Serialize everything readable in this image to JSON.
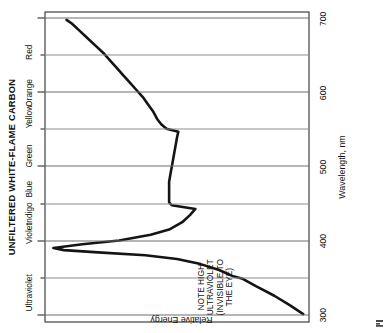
{
  "figure": {
    "title": "UNFILTERED WHITE-FLAME CARBON",
    "corner_mark": "print-registration-mark"
  },
  "annotation": {
    "line1": "NOTE HIGH",
    "line2": "ULTRAVIOLET",
    "line3": "(INVISIBLE TO",
    "line4": "THE EYE)"
  },
  "chart_data": {
    "type": "line",
    "title": "UNFILTERED WHITE-FLAME CARBON",
    "xlabel": "Wavelength, nm",
    "ylabel": "Relative Energy",
    "xlim": [
      290,
      710
    ],
    "ylim": [
      0,
      100
    ],
    "grid": true,
    "grid_axis": "x",
    "legend": "none",
    "orientation_note": "figure printed rotated 90 degrees counter-clockwise",
    "xticks": [
      300,
      400,
      500,
      600,
      700
    ],
    "xtick_labels": [
      "300",
      "400",
      "500",
      "600",
      "700"
    ],
    "xminor_ticks": [
      350,
      450,
      550,
      650
    ],
    "yticks": [],
    "ytick_labels": [],
    "band_labels": [
      {
        "label": "Ultraviolet",
        "wavelength": 330
      },
      {
        "label": "Violet",
        "wavelength": 410
      },
      {
        "label": "Indigo",
        "wavelength": 437
      },
      {
        "label": "Blue",
        "wavelength": 470
      },
      {
        "label": "Green",
        "wavelength": 515
      },
      {
        "label": "Yellow",
        "wavelength": 568
      },
      {
        "label": "Orange",
        "wavelength": 600
      },
      {
        "label": "Red",
        "wavelength": 655
      }
    ],
    "series": [
      {
        "name": "Unfiltered white-flame carbon arc",
        "x": [
          300,
          312,
          325,
          338,
          348,
          352,
          360,
          368,
          375,
          380,
          384,
          387,
          390,
          395,
          400,
          408,
          415,
          425,
          435,
          443,
          448,
          452,
          458,
          465,
          472,
          480,
          490,
          500,
          510,
          520,
          530,
          540,
          548,
          552,
          558,
          565,
          575,
          585,
          595,
          605,
          615,
          625,
          635,
          645,
          655,
          665,
          675,
          685,
          695,
          700
        ],
        "y": [
          2,
          7,
          13,
          20,
          25,
          29,
          34,
          41,
          50,
          62,
          80,
          93,
          97,
          86,
          72,
          60,
          53,
          48,
          45,
          43,
          52,
          53,
          53,
          53,
          53,
          53,
          52.5,
          52,
          51.5,
          51,
          50.5,
          50,
          49.5,
          54,
          56,
          57.5,
          59,
          61,
          63,
          65.5,
          68,
          70.5,
          73,
          75.5,
          78,
          81,
          84,
          87,
          90,
          92
        ]
      }
    ]
  }
}
